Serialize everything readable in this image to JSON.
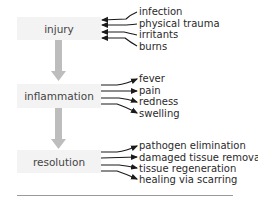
{
  "diagram": {
    "stages": [
      {
        "label": "injury",
        "top": 17,
        "height": 23
      },
      {
        "label": "inflammation",
        "top": 84,
        "height": 24
      },
      {
        "label": "resolution",
        "top": 150,
        "height": 23
      }
    ],
    "groups": [
      {
        "stage": "injury",
        "direction": "in",
        "items": [
          "infection",
          "physical trauma",
          "irritants",
          "burns"
        ]
      },
      {
        "stage": "inflammation",
        "direction": "out",
        "items": [
          "fever",
          "pain",
          "redness",
          "swelling"
        ]
      },
      {
        "stage": "resolution",
        "direction": "out",
        "items": [
          "pathogen elimination",
          "damaged tissue removal",
          "tissue regeneration",
          "healing via scarring"
        ]
      }
    ],
    "colors": {
      "box_fill": "#f3f3f3",
      "connector": "#bdbdbd",
      "arrow": "#1a1a1a",
      "rule": "#9a9a9a"
    }
  }
}
